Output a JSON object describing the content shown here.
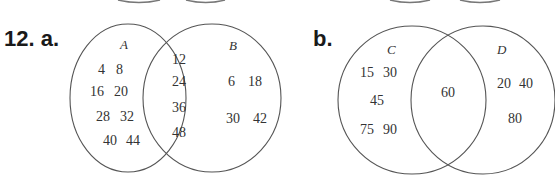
{
  "problem": {
    "number_label": "12. a.",
    "part_b_label": "b."
  },
  "venn_a": {
    "sets": [
      "A",
      "B"
    ],
    "set_a_label": "A",
    "set_b_label": "B",
    "only_a": [
      "4",
      "8",
      "16",
      "20",
      "28",
      "32",
      "40",
      "44"
    ],
    "intersection": [
      "12",
      "24",
      "36",
      "48"
    ],
    "only_b": [
      "6",
      "18",
      "30",
      "42"
    ]
  },
  "venn_b": {
    "sets": [
      "C",
      "D"
    ],
    "set_c_label": "C",
    "set_d_label": "D",
    "only_c": [
      "15",
      "30",
      "45",
      "75",
      "90"
    ],
    "intersection": [
      "60"
    ],
    "only_d": [
      "20",
      "40",
      "80"
    ]
  },
  "colors": {
    "stroke": "#555555",
    "text": "#333333",
    "background": "#ffffff"
  }
}
